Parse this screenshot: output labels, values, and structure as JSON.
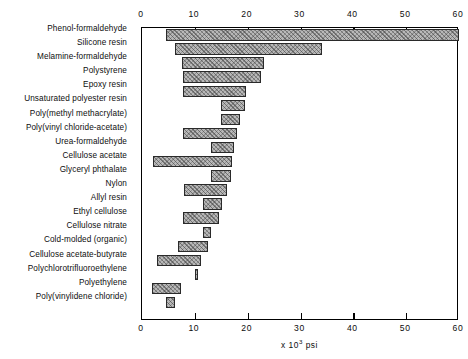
{
  "chart_data": {
    "type": "bar",
    "bar_style": "floating-range-bars-horizontal",
    "orientation": "horizontal",
    "title": "",
    "subtitle": "",
    "xlabel": "x 10³ psi",
    "ylabel": "",
    "xlim": [
      0,
      60
    ],
    "xticks": [
      0,
      10,
      20,
      30,
      40,
      50,
      60
    ],
    "xtick_labels": [
      "0",
      "10",
      "20",
      "30",
      "40",
      "50",
      "60"
    ],
    "grid": false,
    "legend": null,
    "axis_label_exponent": {
      "prefix": "x 10",
      "exponent": "3",
      "suffix": "psi"
    },
    "categories": [
      "Phenol-formaldehyde",
      "Silicone resin",
      "Melamine-formaldehyde",
      "Polystyrene",
      "Epoxy resin",
      "Unsaturated polyester resin",
      "Poly(methyl methacrylate)",
      "Poly(vinyl chloride-acetate)",
      "Urea-formaldehyde",
      "Cellulose acetate",
      "Glyceryl phthalate",
      "Nylon",
      "Allyl resin",
      "Ethyl cellulose",
      "Cellulose nitrate",
      "Cold-molded (organic)",
      "Cellulose acetate-butyrate",
      "Polychlorotrifluoroethylene",
      "Polyethylene",
      "Poly(vinylidene chloride)"
    ],
    "ranges": [
      {
        "category": "Phenol-formaldehyde",
        "low": 4.5,
        "high": 60.0
      },
      {
        "category": "Silicone resin",
        "low": 6.3,
        "high": 34.0
      },
      {
        "category": "Melamine-formaldehyde",
        "low": 7.5,
        "high": 23.0
      },
      {
        "category": "Polystyrene",
        "low": 7.8,
        "high": 22.5
      },
      {
        "category": "Epoxy resin",
        "low": 7.8,
        "high": 19.7
      },
      {
        "category": "Unsaturated polyester resin",
        "low": 15.0,
        "high": 19.5
      },
      {
        "category": "Poly(methyl methacrylate)",
        "low": 15.0,
        "high": 18.5
      },
      {
        "category": "Poly(vinyl chloride-acetate)",
        "low": 7.8,
        "high": 18.0
      },
      {
        "category": "Urea-formaldehyde",
        "low": 13.0,
        "high": 17.5
      },
      {
        "category": "Cellulose acetate",
        "low": 2.0,
        "high": 17.0
      },
      {
        "category": "Glyceryl phthalate",
        "low": 13.0,
        "high": 16.8
      },
      {
        "category": "Nylon",
        "low": 8.0,
        "high": 16.0
      },
      {
        "category": "Allyl resin",
        "low": 11.5,
        "high": 15.2
      },
      {
        "category": "Ethyl cellulose",
        "low": 7.8,
        "high": 14.5
      },
      {
        "category": "Cellulose nitrate",
        "low": 11.5,
        "high": 13.0
      },
      {
        "category": "Cold-molded (organic)",
        "low": 6.8,
        "high": 12.5
      },
      {
        "category": "Cellulose acetate-butyrate",
        "low": 2.8,
        "high": 11.2
      },
      {
        "category": "Polychlorotrifluoroethylene",
        "low": 10.0,
        "high": 10.4
      },
      {
        "category": "Polyethylene",
        "low": 1.8,
        "high": 7.4
      },
      {
        "category": "Poly(vinylidene chloride)",
        "low": 4.5,
        "high": 6.2
      }
    ],
    "colors": {
      "bar_fill": "#b8b8b8",
      "bar_edge": "#2a2a2a",
      "axis": "#000000",
      "background": "#ffffff",
      "text": "#0d0d0d"
    }
  }
}
